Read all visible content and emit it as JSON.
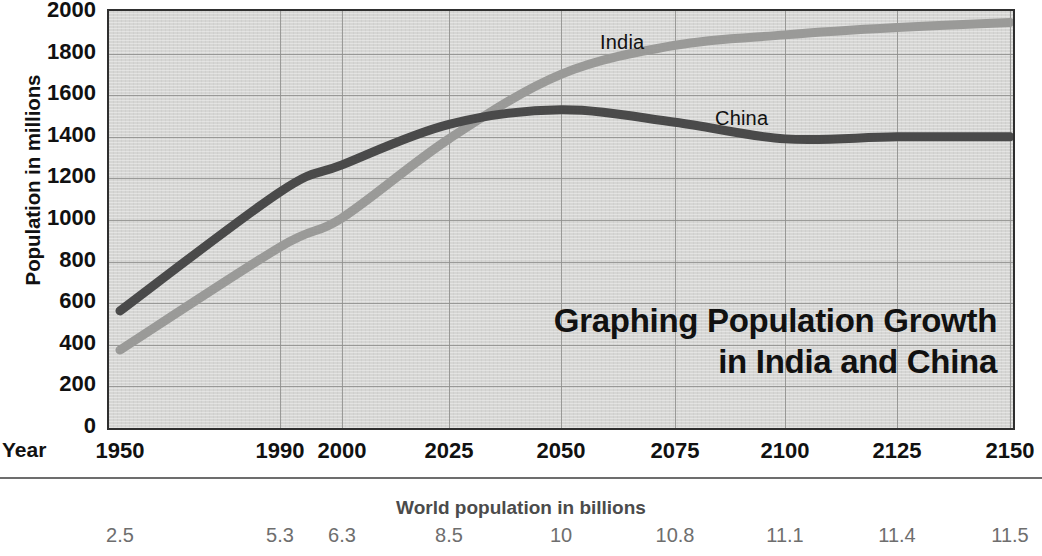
{
  "chart_data": {
    "type": "line",
    "title": "Graphing Population Growth in India and China",
    "title_line1": "Graphing Population Growth",
    "title_line2": "in India and China",
    "ylabel": "Population in millions",
    "xlabel": "Year",
    "ylim": [
      0,
      2000
    ],
    "yticks": [
      0,
      200,
      400,
      600,
      800,
      1000,
      1200,
      1400,
      1600,
      1800,
      2000
    ],
    "xticks": [
      1950,
      1990,
      2000,
      2025,
      2050,
      2075,
      2100,
      2125,
      2150
    ],
    "xtick_labels": [
      "1950",
      "1990",
      "2000",
      "2025",
      "2050",
      "2075",
      "2100",
      "2125",
      "2150"
    ],
    "grid": true,
    "legend": "inline-labels",
    "x": [
      1950,
      1990,
      2000,
      2025,
      2050,
      2075,
      2100,
      2125,
      2150
    ],
    "series": [
      {
        "name": "India",
        "label": "India",
        "color": "#9a9a98",
        "values": [
          375,
          870,
          1010,
          1390,
          1700,
          1840,
          1890,
          1925,
          1950
        ]
      },
      {
        "name": "China",
        "label": "China",
        "color": "#4a4a4a",
        "values": [
          563,
          1135,
          1265,
          1460,
          1530,
          1470,
          1390,
          1400,
          1400
        ]
      }
    ],
    "secondary_axis": {
      "title": "World population in billions",
      "tick_labels": [
        "2.5",
        "5.3",
        "6.3",
        "8.5",
        "10",
        "10.8",
        "11.1",
        "11.4",
        "11.5"
      ],
      "values": [
        2.5,
        5.3,
        6.3,
        8.5,
        10,
        10.8,
        11.1,
        11.4,
        11.5
      ]
    }
  },
  "labels": {
    "india": "India",
    "china": "China"
  },
  "colors": {
    "plot_background": "#d6d6d4",
    "gridline": "#8e8e8c",
    "axis_border": "#2f2f2f",
    "india_line": "#9a9a98",
    "china_line": "#4a4a4a",
    "text": "#111111",
    "secondary_text": "#6e6e6e"
  },
  "footer": {
    "cut_off_text": ""
  }
}
